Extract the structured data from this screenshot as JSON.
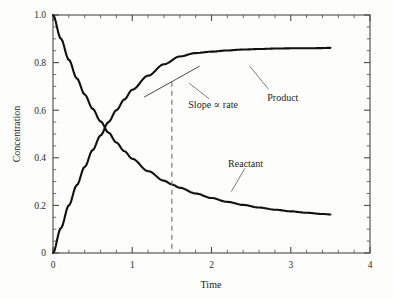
{
  "chart_data": {
    "type": "line",
    "title": "",
    "xlabel": "Time",
    "ylabel": "Concentration",
    "xlim": [
      0,
      4
    ],
    "ylim": [
      0,
      1.0
    ],
    "grid": false,
    "legend_position": "inline-annotations",
    "x_major_ticks": [
      "0",
      "1",
      "2",
      "3",
      "4"
    ],
    "x_major_values": [
      0,
      1,
      2,
      3,
      4
    ],
    "x_minor_step": 0.2,
    "y_major_ticks": [
      "0",
      "0.2",
      "0.4",
      "0.6",
      "0.8",
      "1.0"
    ],
    "y_major_values": [
      0,
      0.2,
      0.4,
      0.6,
      0.8,
      1.0
    ],
    "y_minor_step": 0.05,
    "x": [
      0,
      0.1,
      0.2,
      0.3,
      0.4,
      0.5,
      0.6,
      0.7,
      0.8,
      0.9,
      1.0,
      1.2,
      1.4,
      1.5,
      1.6,
      1.8,
      2.0,
      2.2,
      2.4,
      2.6,
      2.8,
      3.0,
      3.2,
      3.4,
      3.5
    ],
    "series": [
      {
        "name": "Product",
        "color": "#111111",
        "values": [
          0.0,
          0.105,
          0.2,
          0.285,
          0.362,
          0.432,
          0.494,
          0.55,
          0.6,
          0.645,
          0.686,
          0.745,
          0.793,
          0.72,
          0.826,
          0.84,
          0.846,
          0.851,
          0.855,
          0.857,
          0.859,
          0.86,
          0.86,
          0.861,
          0.862
        ]
      },
      {
        "name": "Reactant",
        "color": "#111111",
        "values": [
          1.0,
          0.9,
          0.812,
          0.734,
          0.666,
          0.606,
          0.553,
          0.506,
          0.464,
          0.428,
          0.396,
          0.344,
          0.304,
          0.288,
          0.274,
          0.25,
          0.231,
          0.215,
          0.202,
          0.191,
          0.182,
          0.175,
          0.169,
          0.164,
          0.162
        ]
      }
    ],
    "crossing_point": {
      "x": 0.72,
      "y": 0.5
    },
    "tangent": {
      "at_x": 1.5,
      "at_y": 0.72,
      "x_start": 1.15,
      "x_end": 1.85,
      "y_start": 0.655,
      "y_end": 0.785
    },
    "dashed_marker": {
      "x": 1.5,
      "y_top": 0.72,
      "y_bottom": 0.0
    },
    "annotations": [
      {
        "text": "Product",
        "x": 2.9,
        "y": 0.655
      },
      {
        "text": "Slope ∝ rate",
        "x": 2.02,
        "y": 0.625
      },
      {
        "text": "Reactant",
        "x": 2.43,
        "y": 0.375
      }
    ]
  }
}
